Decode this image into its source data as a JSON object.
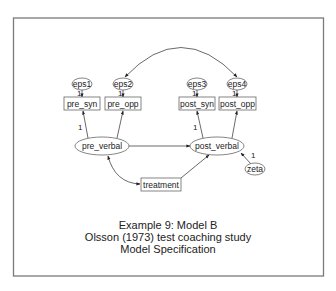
{
  "diagram": {
    "type": "structural-equation-model",
    "colors": {
      "frame_stroke": "#7a7a7a",
      "node_stroke": "#666666",
      "edge_stroke": "#444444",
      "text": "#222222",
      "background": "#ffffff"
    },
    "nodes": {
      "eps1": {
        "label": "eps1",
        "shape": "ellipse"
      },
      "eps2": {
        "label": "eps2",
        "shape": "ellipse"
      },
      "eps3": {
        "label": "eps3",
        "shape": "ellipse"
      },
      "eps4": {
        "label": "eps4",
        "shape": "ellipse"
      },
      "pre_syn": {
        "label": "pre_syn",
        "shape": "rect"
      },
      "pre_opp": {
        "label": "pre_opp",
        "shape": "rect"
      },
      "post_syn": {
        "label": "post_syn",
        "shape": "rect"
      },
      "post_opp": {
        "label": "post_opp",
        "shape": "rect"
      },
      "pre_verbal": {
        "label": "pre_verbal",
        "shape": "ellipse"
      },
      "post_verbal": {
        "label": "post_verbal",
        "shape": "ellipse"
      },
      "treatment": {
        "label": "treatment",
        "shape": "rect"
      },
      "zeta": {
        "label": "zeta",
        "shape": "ellipse"
      }
    },
    "path_labels": {
      "eps1_pre_syn": "1",
      "eps2_pre_opp": "1",
      "eps3_post_syn": "1",
      "eps4_post_opp": "1",
      "pre_verbal_pre_syn": "1",
      "post_verbal_post_syn": "1",
      "zeta_post_verbal": "1"
    },
    "edges": [
      {
        "from": "eps1",
        "to": "pre_syn",
        "type": "directed",
        "label": "1"
      },
      {
        "from": "eps2",
        "to": "pre_opp",
        "type": "directed",
        "label": "1"
      },
      {
        "from": "eps3",
        "to": "post_syn",
        "type": "directed",
        "label": "1"
      },
      {
        "from": "eps4",
        "to": "post_opp",
        "type": "directed",
        "label": "1"
      },
      {
        "from": "pre_verbal",
        "to": "pre_syn",
        "type": "directed",
        "label": "1"
      },
      {
        "from": "pre_verbal",
        "to": "pre_opp",
        "type": "directed"
      },
      {
        "from": "post_verbal",
        "to": "post_syn",
        "type": "directed",
        "label": "1"
      },
      {
        "from": "post_verbal",
        "to": "post_opp",
        "type": "directed"
      },
      {
        "from": "pre_verbal",
        "to": "post_verbal",
        "type": "directed"
      },
      {
        "from": "treatment",
        "to": "post_verbal",
        "type": "directed"
      },
      {
        "from": "zeta",
        "to": "post_verbal",
        "type": "directed",
        "label": "1"
      },
      {
        "from": "pre_verbal",
        "to": "treatment",
        "type": "covariance"
      },
      {
        "from": "eps2",
        "to": "eps4",
        "type": "covariance"
      }
    ],
    "caption": {
      "line1": "Example 9:  Model B",
      "line2": "Olsson (1973) test coaching study",
      "line3": "Model Specification"
    }
  }
}
